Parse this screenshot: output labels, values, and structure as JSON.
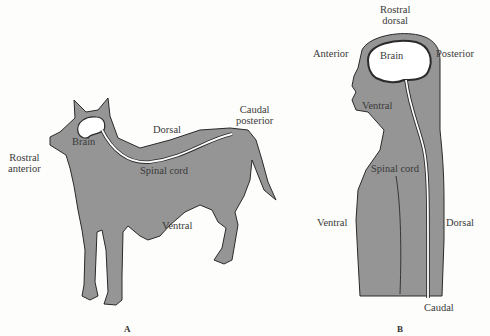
{
  "colors": {
    "body_fill": "#959595",
    "outline": "#2a2a2a",
    "nervous_system": "#ffffff",
    "background": "#fdfdfb"
  },
  "panel_a": {
    "label": "A",
    "subject": "dog",
    "labels": {
      "rostral": "Rostral",
      "anterior": "anterior",
      "brain": "Brain",
      "dorsal": "Dorsal",
      "spinal_cord": "Spinal cord",
      "ventral": "Ventral",
      "caudal": "Caudal",
      "posterior": "posterior"
    }
  },
  "panel_b": {
    "label": "B",
    "subject": "human",
    "labels": {
      "rostral": "Rostral",
      "dorsal_top": "dorsal",
      "anterior": "Anterior",
      "brain": "Brain",
      "posterior": "Posterior",
      "ventral_head": "Ventral",
      "spinal_cord": "Spinal cord",
      "ventral_body": "Ventral",
      "dorsal_body": "Dorsal",
      "caudal": "Caudal"
    }
  }
}
